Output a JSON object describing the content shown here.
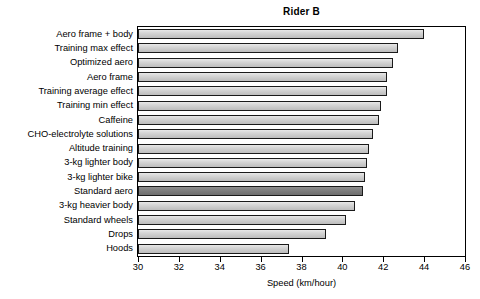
{
  "chart_data": {
    "type": "bar",
    "orientation": "horizontal",
    "title": "Rider B",
    "xlabel": "Speed (km/hour)",
    "ylabel": "",
    "xlim": [
      30,
      46
    ],
    "xticks": [
      30,
      32,
      34,
      36,
      38,
      40,
      42,
      44,
      46
    ],
    "grid": false,
    "legend": null,
    "highlight_category": "Standard aero",
    "colors": {
      "bar_fill": "#d0d0d0",
      "bar_fill_highlight": "#7a7a7a",
      "bar_edge": "#1a1a1a",
      "axis": "#000000",
      "background": "#ffffff",
      "text": "#000000"
    },
    "categories": [
      "Aero frame + body",
      "Training max effect",
      "Optimized aero",
      "Aero frame",
      "Training average effect",
      "Training min effect",
      "Caffeine",
      "CHO-electrolyte solutions",
      "Altitude training",
      "3-kg lighter body",
      "3-kg lighter bike",
      "Standard aero",
      "3-kg heavier body",
      "Standard wheels",
      "Drops",
      "Hoods"
    ],
    "values": [
      44.0,
      42.7,
      42.5,
      42.2,
      42.2,
      41.9,
      41.8,
      41.5,
      41.3,
      41.2,
      41.1,
      41.0,
      40.6,
      40.2,
      39.2,
      37.4
    ]
  }
}
